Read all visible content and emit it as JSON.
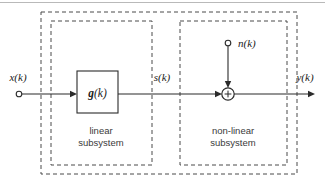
{
  "diagram": {
    "signals": {
      "input": "x(k)",
      "intermediate": "s(k)",
      "noise": "n(k)",
      "output": "y(k)"
    },
    "blocks": [
      {
        "id": "g-block",
        "label_main": "g",
        "label_arg": "(k)",
        "shape": "rectangle"
      }
    ],
    "operators": [
      {
        "id": "summing-junction",
        "symbol": "+",
        "shape": "circle"
      }
    ],
    "subsystems": [
      {
        "id": "linear",
        "line1": "linear",
        "line2": "subsystem"
      },
      {
        "id": "non-linear",
        "line1": "non-linear",
        "line2": "subsystem"
      }
    ],
    "colors": {
      "line": "#2b2b2b",
      "dashed": "#4a4a4a",
      "text": "#1a1a1a",
      "sub_text": "#3a3a3a",
      "background": "#ffffff",
      "artifact": "#b9b9b9"
    }
  }
}
